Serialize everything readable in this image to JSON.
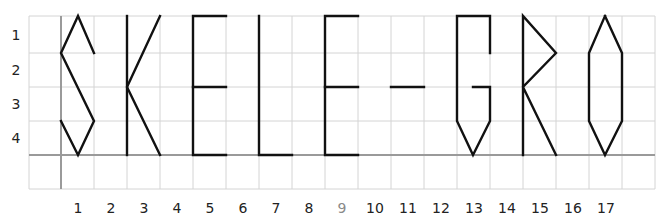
{
  "diagram": {
    "word": "SKELE-GRO",
    "colors": {
      "grid": "#d4d4d4",
      "axis": "#9a9a9a",
      "stroke": "#111111",
      "label": "#222222",
      "label_muted": "#8a8a8a"
    },
    "grid": {
      "col_edges": [
        29,
        61,
        94,
        127,
        160,
        193,
        226,
        259,
        292,
        325,
        358,
        391,
        424,
        457,
        490,
        523,
        556,
        589,
        622,
        655
      ],
      "row_edges": [
        16,
        53,
        87,
        121,
        155,
        189
      ],
      "axis_x": 61,
      "axis_y": 155
    },
    "row_labels": [
      {
        "text": "1",
        "y": 35
      },
      {
        "text": "2",
        "y": 70
      },
      {
        "text": "3",
        "y": 104
      },
      {
        "text": "4",
        "y": 138
      }
    ],
    "col_labels": [
      {
        "text": "1",
        "x": 78,
        "muted": false
      },
      {
        "text": "2",
        "x": 111,
        "muted": false
      },
      {
        "text": "3",
        "x": 144,
        "muted": false
      },
      {
        "text": "4",
        "x": 177,
        "muted": false
      },
      {
        "text": "5",
        "x": 210,
        "muted": false
      },
      {
        "text": "6",
        "x": 243,
        "muted": false
      },
      {
        "text": "7",
        "x": 276,
        "muted": false
      },
      {
        "text": "8",
        "x": 309,
        "muted": false
      },
      {
        "text": "9",
        "x": 342,
        "muted": true
      },
      {
        "text": "10",
        "x": 375,
        "muted": false
      },
      {
        "text": "11",
        "x": 408,
        "muted": false
      },
      {
        "text": "12",
        "x": 441,
        "muted": false
      },
      {
        "text": "13",
        "x": 474,
        "muted": false
      },
      {
        "text": "14",
        "x": 507,
        "muted": false
      },
      {
        "text": "15",
        "x": 540,
        "muted": false
      },
      {
        "text": "16",
        "x": 573,
        "muted": false
      },
      {
        "text": "17",
        "x": 606,
        "muted": false
      }
    ],
    "letters": [
      {
        "char": "S",
        "column": 1,
        "polylines": [
          [
            [
              94,
              53
            ],
            [
              78,
              16
            ],
            [
              61,
              53
            ],
            [
              94,
              121
            ],
            [
              78,
              155
            ],
            [
              61,
              121
            ]
          ]
        ]
      },
      {
        "char": "K",
        "column": 3,
        "polylines": [
          [
            [
              127,
              16
            ],
            [
              127,
              155
            ]
          ],
          [
            [
              160,
              16
            ],
            [
              127,
              87
            ],
            [
              160,
              155
            ]
          ]
        ]
      },
      {
        "char": "E",
        "column": 5,
        "polylines": [
          [
            [
              226,
              16
            ],
            [
              193,
              16
            ],
            [
              193,
              155
            ],
            [
              226,
              155
            ]
          ],
          [
            [
              193,
              87
            ],
            [
              226,
              87
            ]
          ]
        ]
      },
      {
        "char": "L",
        "column": 7,
        "polylines": [
          [
            [
              259,
              16
            ],
            [
              259,
              155
            ],
            [
              292,
              155
            ]
          ]
        ]
      },
      {
        "char": "E",
        "column": 9,
        "polylines": [
          [
            [
              358,
              16
            ],
            [
              325,
              16
            ],
            [
              325,
              155
            ],
            [
              358,
              155
            ]
          ],
          [
            [
              325,
              87
            ],
            [
              358,
              87
            ]
          ]
        ]
      },
      {
        "char": "-",
        "column": 11,
        "polylines": [
          [
            [
              391,
              87
            ],
            [
              424,
              87
            ]
          ]
        ]
      },
      {
        "char": "G",
        "column": 13,
        "polylines": [
          [
            [
              490,
              53
            ],
            [
              490,
              16
            ],
            [
              457,
              16
            ],
            [
              457,
              121
            ],
            [
              473,
              155
            ],
            [
              490,
              121
            ],
            [
              490,
              87
            ],
            [
              473,
              87
            ]
          ]
        ]
      },
      {
        "char": "R",
        "column": 15,
        "polylines": [
          [
            [
              523,
              155
            ],
            [
              523,
              16
            ],
            [
              556,
              53
            ],
            [
              523,
              87
            ],
            [
              556,
              155
            ]
          ]
        ]
      },
      {
        "char": "O",
        "column": 17,
        "polylines": [
          [
            [
              605,
              16
            ],
            [
              622,
              53
            ],
            [
              622,
              121
            ],
            [
              605,
              155
            ],
            [
              589,
              121
            ],
            [
              589,
              53
            ],
            [
              605,
              16
            ]
          ]
        ]
      }
    ]
  }
}
